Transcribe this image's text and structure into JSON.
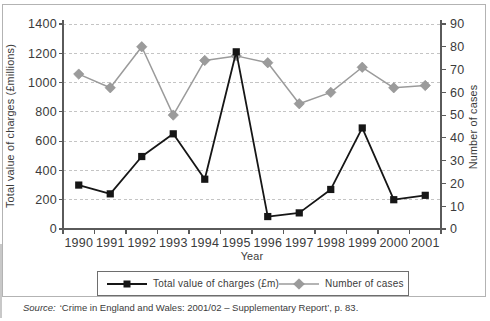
{
  "chart_data": {
    "type": "line",
    "title": "",
    "x_categories": [
      "1990",
      "1991",
      "1992",
      "1993",
      "1994",
      "1995",
      "1996",
      "1997",
      "1998",
      "1999",
      "2000",
      "2001"
    ],
    "series": [
      {
        "name": "Total value of charges (£m)",
        "axis": "left",
        "marker": "square",
        "color": "#161616",
        "values": [
          300,
          240,
          495,
          650,
          340,
          1210,
          85,
          110,
          270,
          690,
          200,
          230
        ]
      },
      {
        "name": "Number of cases",
        "axis": "right",
        "marker": "diamond",
        "color": "#9b9b9b",
        "values": [
          68,
          62,
          80,
          50,
          74,
          76,
          73,
          55,
          60,
          71,
          62,
          63
        ]
      }
    ],
    "left_axis": {
      "label": "Total value of charges (£millions)",
      "min": 0,
      "max": 1400,
      "step": 200
    },
    "right_axis": {
      "label": "Number of cases",
      "min": 0,
      "max": 90,
      "step": 10
    },
    "x_axis": {
      "label": "Year"
    },
    "grid": {
      "horizontal": true,
      "style": "dashed"
    },
    "legend_position": "bottom"
  },
  "source_note": {
    "prefix": "Source:",
    "text": "‘Crime in England and Wales: 2001/02 – Supplementary Report’, p. 83."
  },
  "colors": {
    "series1": "#161616",
    "series2": "#9b9b9b",
    "series2_edge": "#8d8d8d",
    "gridline": "#c4c4c4",
    "axis": "#5a5a5a",
    "text": "#3b3b3b",
    "frame_border": "#b3b3b3",
    "legend_border": "#6e6e6e"
  }
}
